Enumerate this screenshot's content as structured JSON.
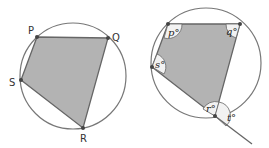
{
  "left_diagram": {
    "labels": {
      "P": "P",
      "Q": "Q",
      "R": "R",
      "S": "S"
    }
  },
  "right_diagram": {
    "angles": {
      "p": "p°",
      "q": "q°",
      "r": "r°",
      "s": "s°",
      "t": "t°"
    }
  },
  "colors": {
    "fill": "#b3b3b3",
    "stroke": "#666666",
    "circle": "#777777"
  }
}
